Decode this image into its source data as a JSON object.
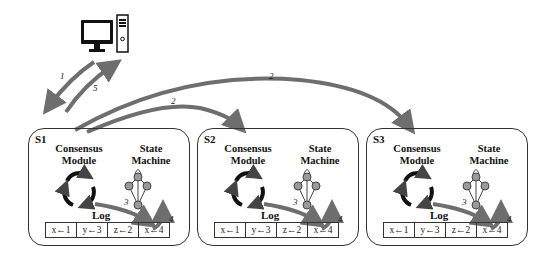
{
  "client": {
    "icon": "desktop-computer-icon"
  },
  "edges": [
    {
      "label": "1",
      "from": "client",
      "to": "S1"
    },
    {
      "label": "5",
      "from": "S1",
      "to": "client"
    },
    {
      "label": "2",
      "from": "S1",
      "to": "S2"
    },
    {
      "label": "2",
      "from": "S1",
      "to": "S3"
    }
  ],
  "servers": [
    {
      "id": "S1",
      "consensus_line1": "Consensus",
      "consensus_line2": "Module",
      "state_line1": "State",
      "state_line2": "Machine",
      "log_label": "Log",
      "log": [
        "x←1",
        "y←3",
        "z←2",
        "x←4"
      ],
      "step_apply": "3",
      "step_exec": "4"
    },
    {
      "id": "S2",
      "consensus_line1": "Consensus",
      "consensus_line2": "Module",
      "state_line1": "State",
      "state_line2": "Machine",
      "log_label": "Log",
      "log": [
        "x←1",
        "y←3",
        "z←2",
        "x←4"
      ],
      "step_apply": "3",
      "step_exec": "4"
    },
    {
      "id": "S3",
      "consensus_line1": "Consensus",
      "consensus_line2": "Module",
      "state_line1": "State",
      "state_line2": "Machine",
      "log_label": "Log",
      "log": [
        "x←1",
        "y←3",
        "z←2",
        "x←4"
      ],
      "step_apply": "3",
      "step_exec": "4"
    }
  ],
  "colors": {
    "arrow": "#6e6e6e",
    "node": "#9a9a9a",
    "border": "#333333"
  }
}
